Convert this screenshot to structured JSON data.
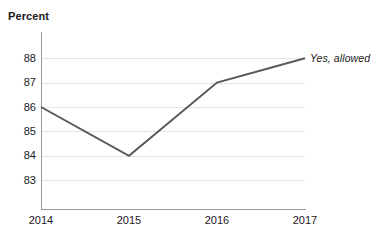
{
  "chart_data": {
    "type": "line",
    "title": "",
    "ylabel": "Percent",
    "xlabel": "",
    "categories": [
      "2014",
      "2015",
      "2016",
      "2017"
    ],
    "x": [
      2014,
      2015,
      2016,
      2017
    ],
    "series": [
      {
        "name": "Yes, allowed",
        "values": [
          86,
          84,
          87,
          88
        ],
        "color": "#595959",
        "annotation": "Yes, allowed",
        "annotation_position": "right-end"
      }
    ],
    "ylim": [
      82.5,
      88.5
    ],
    "y_ticks": [
      88,
      87,
      86,
      85,
      84,
      83
    ],
    "y_tick_labels": [
      "88",
      "87",
      "86",
      "85",
      "84",
      "83"
    ],
    "x_tick_labels": [
      "2014",
      "2015",
      "2016",
      "2017"
    ],
    "grid": true,
    "grid_axis": "y",
    "grid_color": "#e3e3e3",
    "legend": "none",
    "axis_color": "#9a9a9a",
    "background": "#ffffff",
    "text_color": "#1a1a1a"
  }
}
